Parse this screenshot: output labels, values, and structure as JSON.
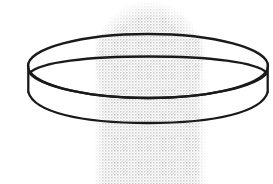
{
  "figure": {
    "title": "Shallow cylindrical ring drawing over halftone silhouette",
    "canvas": {
      "width": 273,
      "height": 184,
      "background_color": "#ffffff"
    },
    "ink_color": "#1c1c1c",
    "halftone_color": "#d8d8d8",
    "halftone_dot_color": "#cfcfcf",
    "objects": [
      {
        "name": "halftone-silhouette",
        "description": "light gray screened silhouette: rounded dome on top of a vertical column",
        "dome": {
          "cx": 149,
          "cy": 55,
          "rx": 52,
          "ry": 56
        },
        "column": {
          "x": 95,
          "y": 40,
          "width": 110,
          "height": 144
        },
        "fill": "#d9d9d9"
      },
      {
        "name": "ring-outer-top-ellipse",
        "description": "outer rim top edge of the shallow cylinder",
        "cx": 148,
        "cy": 66,
        "rx": 120,
        "ry": 32,
        "stroke": "#1c1c1c",
        "stroke_width": 2.2
      },
      {
        "name": "ring-inner-top-ellipse",
        "description": "inner rim edge, drawn as a flatter ellipse inset inside the outer one",
        "cx": 148,
        "cy": 77,
        "rx": 117,
        "ry": 21,
        "stroke": "#1c1c1c",
        "stroke_width": 2.2
      },
      {
        "name": "ring-bottom-arc",
        "description": "front lower edge of the cylinder wall, visible arc from left wall to right wall",
        "start": {
          "x": 28,
          "y": 68
        },
        "end": {
          "x": 268,
          "y": 68
        },
        "sag": 55,
        "stroke": "#1c1c1c",
        "stroke_width": 2.2
      },
      {
        "name": "ring-left-wall",
        "description": "short vertical silhouette edge at the left of the cylinder wall",
        "x": 28,
        "y_top": 64,
        "y_bottom": 90,
        "stroke": "#1c1c1c",
        "stroke_width": 2.2
      },
      {
        "name": "ring-right-wall",
        "description": "short vertical silhouette edge at the right of the cylinder wall",
        "x": 268,
        "y_top": 64,
        "y_bottom": 90,
        "stroke": "#1c1c1c",
        "stroke_width": 2.2
      }
    ]
  }
}
